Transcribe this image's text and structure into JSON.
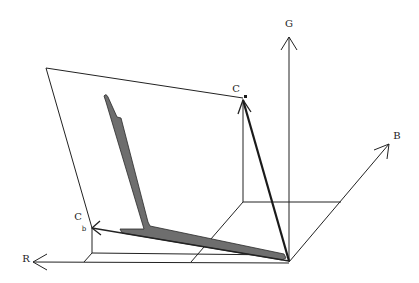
{
  "diagram": {
    "type": "3D RGB color space vector diagram",
    "axes": [
      {
        "id": "G",
        "label": "G"
      },
      {
        "id": "B",
        "label": "B"
      },
      {
        "id": "R",
        "label": "R"
      }
    ],
    "vectors": [
      {
        "id": "Ca",
        "label": "C",
        "subscript": "a"
      },
      {
        "id": "Cb",
        "label": "C",
        "subscript": "b"
      }
    ],
    "plane": {
      "description": "plane spanned by Ca and Cb"
    },
    "band": {
      "description": "shaded gray L-shaped region within plane"
    },
    "colors": {
      "line": "#222222",
      "band_fill": "#6e6e6e",
      "background": "#ffffff"
    }
  }
}
